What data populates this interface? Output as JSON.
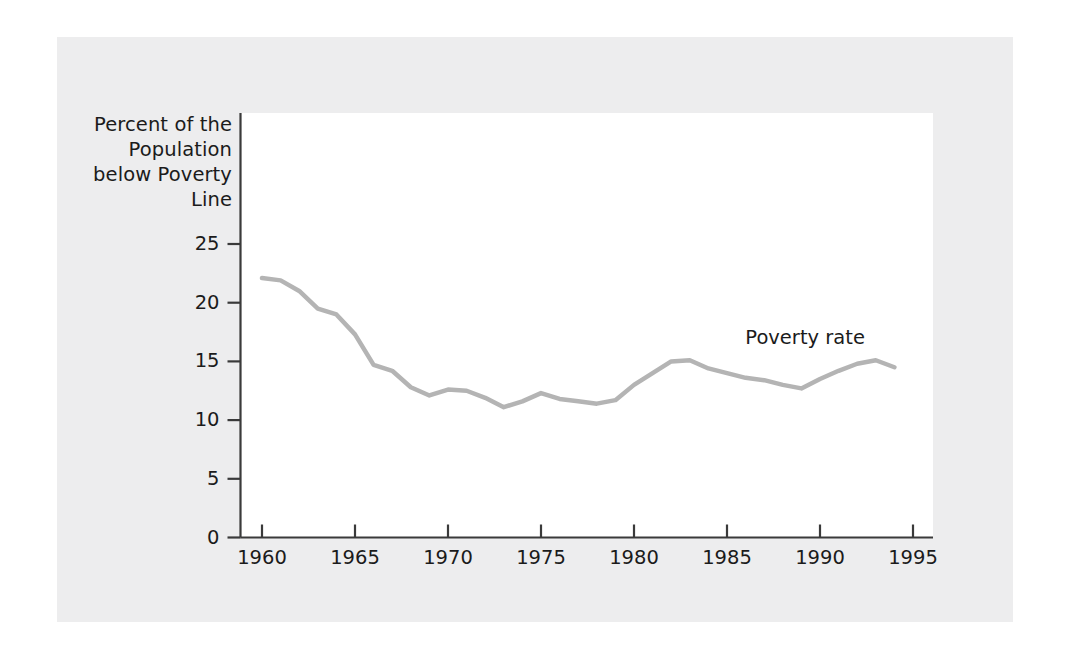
{
  "figure": {
    "background_color": "#ffffff",
    "panel_color": "#ededee",
    "plot_area_color": "#ffffff",
    "axis_color": "#3a3a3a",
    "text_color": "#1b1b1b"
  },
  "chart_data": {
    "type": "line",
    "title": "",
    "xlabel": "",
    "ylabel": "Percent of the Population below Poverty Line",
    "ylabel_lines": [
      "Percent of the",
      "Population",
      "below Poverty",
      "Line"
    ],
    "xlim": [
      1960,
      1995
    ],
    "ylim": [
      0,
      26.5
    ],
    "xticks": [
      1960,
      1965,
      1970,
      1975,
      1980,
      1985,
      1990,
      1995
    ],
    "xtick_labels": [
      "1960",
      "1965",
      "1970",
      "1975",
      "1980",
      "1985",
      "1990",
      "1995"
    ],
    "yticks": [
      0,
      5,
      10,
      15,
      20,
      25
    ],
    "ytick_labels": [
      "0",
      "5",
      "10",
      "15",
      "20",
      "25"
    ],
    "grid": false,
    "legend": "none",
    "annotations": [
      {
        "text": "Poverty rate",
        "x": 1989.2,
        "y": 17.0
      }
    ],
    "series": [
      {
        "name": "Poverty rate",
        "color": "#b4b4b4",
        "line_width": 4.5,
        "x": [
          1960,
          1961,
          1962,
          1963,
          1964,
          1965,
          1966,
          1967,
          1968,
          1969,
          1970,
          1971,
          1972,
          1973,
          1974,
          1975,
          1976,
          1977,
          1978,
          1979,
          1980,
          1981,
          1982,
          1983,
          1984,
          1985,
          1986,
          1987,
          1988,
          1989,
          1990,
          1991,
          1992,
          1993,
          1994
        ],
        "values": [
          22.1,
          21.9,
          21.0,
          19.5,
          19.0,
          17.3,
          14.7,
          14.2,
          12.8,
          12.1,
          12.6,
          12.5,
          11.9,
          11.1,
          11.6,
          12.3,
          11.8,
          11.6,
          11.4,
          11.7,
          13.0,
          14.0,
          15.0,
          15.1,
          14.4,
          14.0,
          13.6,
          13.4,
          13.0,
          12.7,
          13.5,
          14.2,
          14.8,
          15.1,
          14.5
        ]
      }
    ]
  }
}
